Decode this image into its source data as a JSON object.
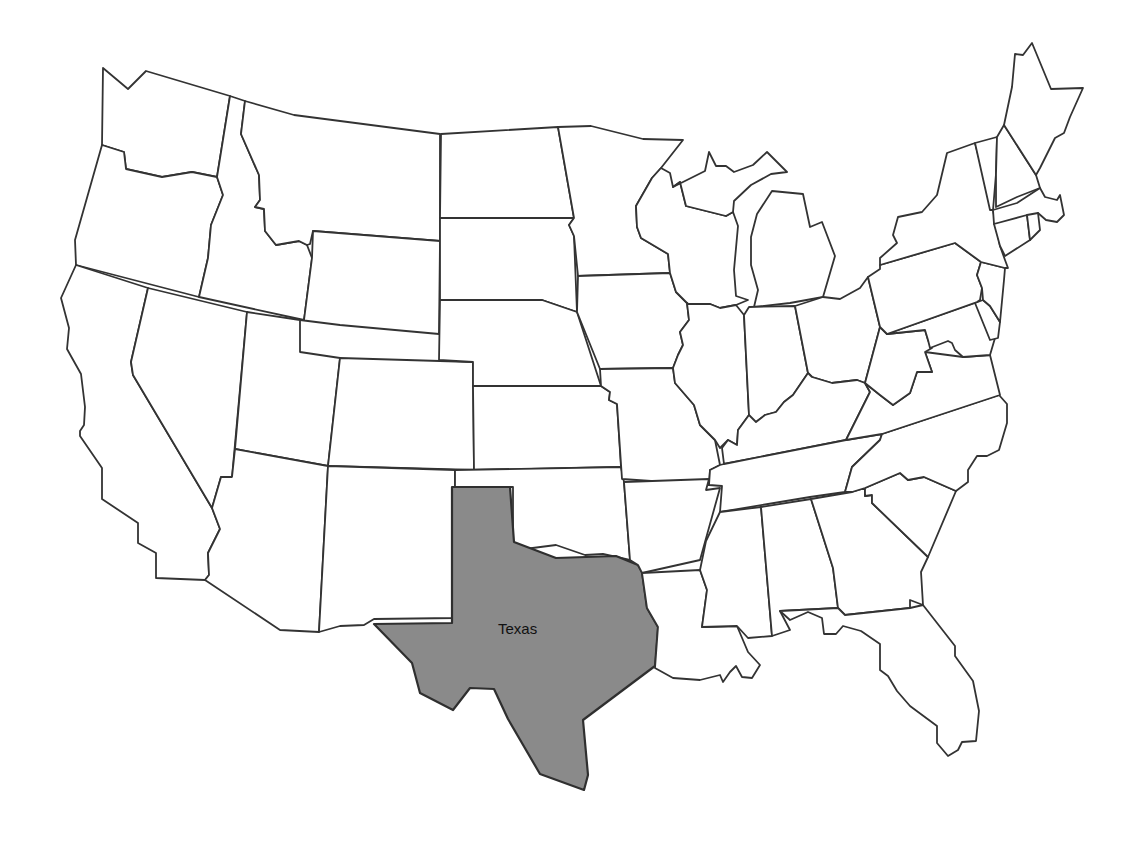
{
  "map": {
    "title": "United States (contiguous)",
    "highlighted_state": "Texas",
    "highlight_color": "#8a8a8a",
    "default_fill": "#ffffff",
    "stroke_color": "#333333",
    "labels": [
      {
        "state": "Texas",
        "text": "Texas",
        "x": 498,
        "y": 634
      }
    ],
    "states": [
      "Washington",
      "Oregon",
      "California",
      "Idaho",
      "Nevada",
      "Montana",
      "Wyoming",
      "Utah",
      "Arizona",
      "Colorado",
      "New Mexico",
      "North Dakota",
      "South Dakota",
      "Nebraska",
      "Kansas",
      "Oklahoma",
      "Texas",
      "Minnesota",
      "Iowa",
      "Missouri",
      "Arkansas",
      "Louisiana",
      "Wisconsin",
      "Illinois",
      "Michigan",
      "Indiana",
      "Ohio",
      "Kentucky",
      "Tennessee",
      "Mississippi",
      "Alabama",
      "Georgia",
      "Florida",
      "South Carolina",
      "North Carolina",
      "Virginia",
      "West Virginia",
      "Maryland",
      "Delaware",
      "Pennsylvania",
      "New Jersey",
      "New York",
      "Connecticut",
      "Rhode Island",
      "Massachusetts",
      "Vermont",
      "New Hampshire",
      "Maine"
    ]
  }
}
